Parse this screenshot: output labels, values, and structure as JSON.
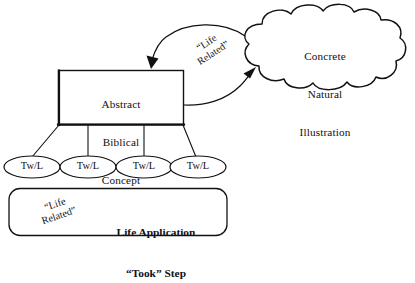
{
  "figure": {
    "background_color": "#ffffff",
    "ink_color": "#111111"
  },
  "concept_box": {
    "name": "Abstract Biblical Concept",
    "line1": "Abstract",
    "line2": "Biblical",
    "line3": "Concept"
  },
  "cloud": {
    "name": "Concrete Natural Illustration",
    "line1": "Concrete",
    "line2": "Natural",
    "line3": "Illustration"
  },
  "arrow_label_upper": {
    "line1": "“Life",
    "line2": "Related”"
  },
  "arrow_label_lower": {
    "line1": "“Life",
    "line2": "Related”"
  },
  "nodes": [
    {
      "label": "Tw/L"
    },
    {
      "label": "Tw/L"
    },
    {
      "label": "Tw/L"
    },
    {
      "label": "Tw/L"
    }
  ],
  "application_box": {
    "line1": "Life Application",
    "line2": "“Took” Step"
  }
}
